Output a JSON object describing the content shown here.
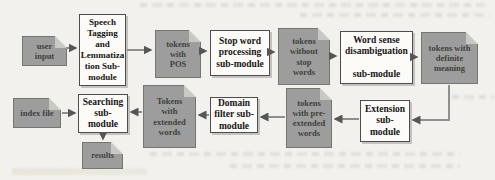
{
  "figure_type": "flowchart",
  "colors": {
    "page_bg": "#f2f1ed",
    "module_fill": "#fcfbf7",
    "module_border": "#4d4d4d",
    "module_text": "#161616",
    "doc_fill": "#9d9d9d",
    "doc_border": "#76766f",
    "doc_text": "#3d423c",
    "doc_fold": "#c9c9c3",
    "arrow_line": "#8f8f8f",
    "arrow_head": "#565656"
  },
  "nodes": {
    "user_input": {
      "label": "user\ninput",
      "kind": "document"
    },
    "speech_tagging": {
      "label": "Speech\nTagging\nand\nLemmatiza\ntion Sub-\nmodule",
      "kind": "module"
    },
    "tokens_pos": {
      "label": "tokens\nwith\nPOS",
      "kind": "document"
    },
    "stop_word": {
      "label": "Stop word\nprocessing\nsub-module",
      "kind": "module"
    },
    "tokens_no_stop": {
      "label": "tokens\nwithout\nstop\nwords",
      "kind": "document"
    },
    "word_sense": {
      "label": "Word sense\ndisambiguation\n\nsub-module",
      "kind": "module"
    },
    "tokens_definite": {
      "label": "tokens with\ndefinite\nmeaning",
      "kind": "document"
    },
    "extension": {
      "label": "Extension\nsub-\nmodule",
      "kind": "module"
    },
    "tokens_pre_extended": {
      "label": "tokens\nwith pre-\nextended\nwords",
      "kind": "document"
    },
    "domain_filter": {
      "label": "Domain\nfilter sub-\nmodule",
      "kind": "module"
    },
    "tokens_extended": {
      "label": "Tokens\nwith\nextended\nwords",
      "kind": "document"
    },
    "searching": {
      "label": "Searching\nsub-\nmodule",
      "kind": "module"
    },
    "index_file": {
      "label": "index file",
      "kind": "document"
    },
    "results": {
      "label": "results",
      "kind": "document"
    }
  },
  "edges": [
    {
      "from": "user_input",
      "to": "speech_tagging"
    },
    {
      "from": "speech_tagging",
      "to": "tokens_pos"
    },
    {
      "from": "tokens_pos",
      "to": "stop_word"
    },
    {
      "from": "stop_word",
      "to": "tokens_no_stop"
    },
    {
      "from": "tokens_no_stop",
      "to": "word_sense"
    },
    {
      "from": "word_sense",
      "to": "tokens_definite"
    },
    {
      "from": "tokens_definite",
      "to": "extension"
    },
    {
      "from": "extension",
      "to": "tokens_pre_extended"
    },
    {
      "from": "tokens_pre_extended",
      "to": "domain_filter"
    },
    {
      "from": "domain_filter",
      "to": "tokens_extended"
    },
    {
      "from": "tokens_extended",
      "to": "searching"
    },
    {
      "from": "index_file",
      "to": "searching"
    },
    {
      "from": "searching",
      "to": "results"
    }
  ]
}
